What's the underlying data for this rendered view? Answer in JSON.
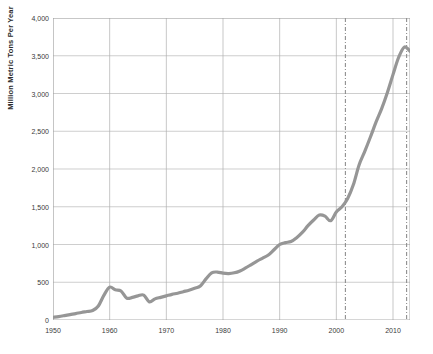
{
  "chart_data": {
    "type": "line",
    "title": "",
    "xlabel": "",
    "ylabel": "Million Metric Tons Per Year",
    "xlim": [
      1950,
      2013
    ],
    "ylim": [
      0,
      4000
    ],
    "grid": true,
    "legend": "none",
    "line_color": "#969696",
    "x_ticks": [
      "1950",
      "1960",
      "1970",
      "1980",
      "1990",
      "2000",
      "2010"
    ],
    "x_tick_values": [
      1950,
      1960,
      1970,
      1980,
      1990,
      2000,
      2010
    ],
    "y_ticks": [
      "0",
      "500",
      "1,000",
      "1,500",
      "2,000",
      "2,500",
      "3,000",
      "3,500",
      "4,000"
    ],
    "y_tick_values": [
      0,
      500,
      1000,
      1500,
      2000,
      2500,
      3000,
      3500,
      4000
    ],
    "x": [
      1950,
      1951,
      1952,
      1953,
      1954,
      1955,
      1956,
      1957,
      1958,
      1959,
      1960,
      1961,
      1962,
      1963,
      1964,
      1965,
      1966,
      1967,
      1968,
      1969,
      1970,
      1971,
      1972,
      1973,
      1974,
      1975,
      1976,
      1977,
      1978,
      1979,
      1980,
      1981,
      1982,
      1983,
      1984,
      1985,
      1986,
      1987,
      1988,
      1989,
      1990,
      1991,
      1992,
      1993,
      1994,
      1995,
      1996,
      1997,
      1998,
      1999,
      2000,
      2001,
      2002,
      2003,
      2004,
      2005,
      2006,
      2007,
      2008,
      2009,
      2010,
      2011,
      2012,
      2013
    ],
    "values": [
      35,
      45,
      58,
      72,
      85,
      100,
      112,
      125,
      185,
      330,
      435,
      400,
      385,
      290,
      300,
      320,
      330,
      240,
      280,
      300,
      320,
      340,
      355,
      375,
      395,
      420,
      450,
      545,
      625,
      635,
      620,
      615,
      625,
      650,
      690,
      735,
      780,
      820,
      860,
      930,
      1000,
      1025,
      1040,
      1090,
      1160,
      1250,
      1325,
      1390,
      1375,
      1315,
      1430,
      1500,
      1610,
      1790,
      2050,
      2230,
      2420,
      2620,
      2800,
      3010,
      3250,
      3480,
      3615,
      3560
    ],
    "series": [
      {
        "name": "Annual production",
        "values": [
          35,
          45,
          58,
          72,
          85,
          100,
          112,
          125,
          185,
          330,
          435,
          400,
          385,
          290,
          300,
          320,
          330,
          240,
          280,
          300,
          320,
          340,
          355,
          375,
          395,
          420,
          450,
          545,
          625,
          635,
          620,
          615,
          625,
          650,
          690,
          735,
          780,
          820,
          860,
          930,
          1000,
          1025,
          1040,
          1090,
          1160,
          1250,
          1325,
          1390,
          1375,
          1315,
          1430,
          1500,
          1610,
          1790,
          2050,
          2230,
          2420,
          2620,
          2800,
          3010,
          3250,
          3480,
          3615,
          3560
        ]
      }
    ],
    "annotations": [
      {
        "name": "reference-line-1",
        "x": 2001.6,
        "style": "dash-dot",
        "label": ""
      },
      {
        "name": "reference-line-2",
        "x": 2012.4,
        "style": "dash-dot",
        "label": ""
      }
    ]
  }
}
